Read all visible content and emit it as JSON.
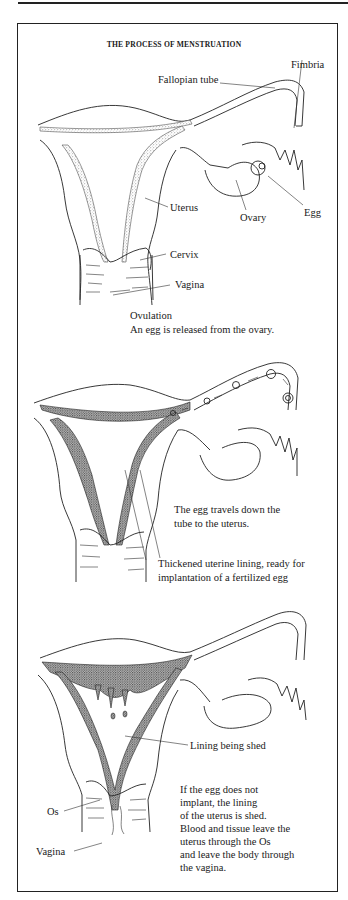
{
  "figure": {
    "title": "THE PROCESS OF MENSTRUATION",
    "panels": [
      {
        "id": "ovulation",
        "labels": {
          "fimbria": "Fimbria",
          "fallopian_tube": "Fallopian tube",
          "uterus": "Uterus",
          "ovary": "Ovary",
          "egg": "Egg",
          "cervix": "Cervix",
          "vagina": "Vagina"
        },
        "caption": {
          "heading": "Ovulation",
          "text": "An egg is released from the ovary."
        }
      },
      {
        "id": "egg-travels",
        "caption": {
          "line1": "The egg travels down the",
          "line2": "tube to the uterus."
        },
        "labels": {
          "lining_line1": "Thickened uterine lining, ready for",
          "lining_line2": "implantation of a fertilized egg"
        }
      },
      {
        "id": "shedding",
        "labels": {
          "lining_shed": "Lining being shed",
          "os": "Os",
          "vagina": "Vagina"
        },
        "caption": {
          "lines": [
            "If the egg does not",
            "implant, the lining",
            "of the uterus is shed.",
            "Blood and tissue leave the",
            "uterus through the Os",
            "and leave the body through",
            "the vagina."
          ]
        }
      }
    ]
  }
}
